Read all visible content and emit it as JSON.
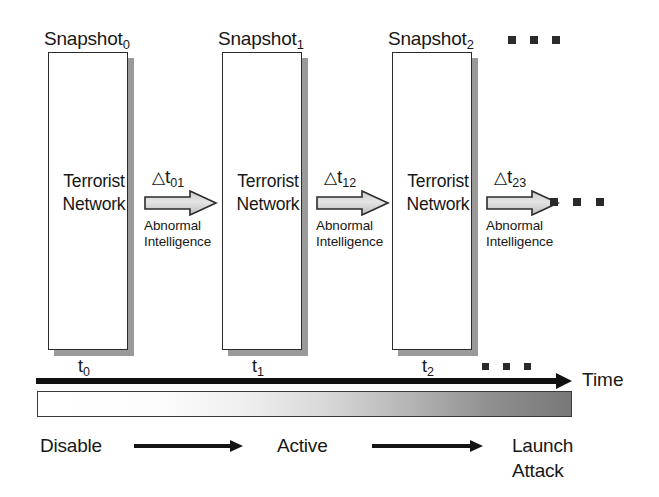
{
  "diagram": {
    "snapshots": [
      {
        "title_base": "Snapshot",
        "title_sub": "0",
        "label_line1": "Terrorist",
        "label_line2": "Network",
        "tick_base": "t",
        "tick_sub": "0"
      },
      {
        "title_base": "Snapshot",
        "title_sub": "1",
        "label_line1": "Terrorist",
        "label_line2": "Network",
        "tick_base": "t",
        "tick_sub": "1"
      },
      {
        "title_base": "Snapshot",
        "title_sub": "2",
        "label_line1": "Terrorist",
        "label_line2": "Network",
        "tick_base": "t",
        "tick_sub": "2"
      }
    ],
    "transitions": [
      {
        "delta_symbol": "△",
        "delta_base": "t",
        "delta_sub": "01",
        "caption_line1": "Abnormal",
        "caption_line2": "Intelligence"
      },
      {
        "delta_symbol": "△",
        "delta_base": "t",
        "delta_sub": "12",
        "caption_line1": "Abnormal",
        "caption_line2": "Intelligence"
      },
      {
        "delta_symbol": "△",
        "delta_base": "t",
        "delta_sub": "23",
        "caption_line1": "Abnormal",
        "caption_line2": "Intelligence"
      }
    ],
    "axis": {
      "caption": "Time"
    },
    "stages": {
      "start_label": "Disable",
      "middle_label": "Active",
      "end_label_line1": "Launch",
      "end_label_line2": "Attack"
    },
    "ellipsis": {
      "glyph": "▪"
    },
    "colors": {
      "box_border": "#2b2b2b",
      "box_shadow": "#9a9a9a",
      "block_arrow_fill": "#d4d4d4",
      "block_arrow_stroke": "#2b2b2b",
      "axis": "#111111",
      "text": "#181818",
      "gradient_start": "#ffffff",
      "gradient_end": "#787878"
    }
  }
}
